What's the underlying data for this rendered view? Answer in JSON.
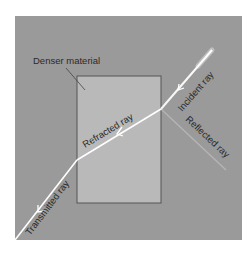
{
  "diagram": {
    "colors": {
      "background": "#9a9a9a",
      "material": "#b9b9b9",
      "material_border": "#555555",
      "ray": "#ffffff",
      "reflected_ray": "#b0b0b0",
      "text": "#2a2a2a"
    },
    "labels": {
      "material": "Denser material",
      "incident": "Incident ray",
      "reflected": "Reflected ray",
      "refracted": "Refracted ray",
      "transmitted": "Transmitted ray"
    }
  }
}
